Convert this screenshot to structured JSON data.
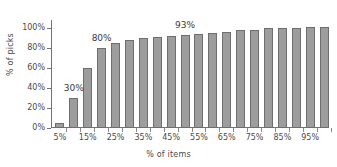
{
  "chart_data": {
    "type": "bar",
    "title": "",
    "xlabel": "% of items",
    "ylabel": "% of picks",
    "categories": [
      "5%",
      "10%",
      "15%",
      "20%",
      "25%",
      "30%",
      "35%",
      "40%",
      "45%",
      "50%",
      "55%",
      "60%",
      "65%",
      "70%",
      "75%",
      "80%",
      "85%",
      "90%",
      "95%",
      "100%"
    ],
    "values": [
      5,
      30,
      60,
      80,
      85,
      88,
      90,
      91,
      92,
      93,
      94,
      95,
      96,
      98,
      98,
      100,
      100,
      100,
      101,
      101
    ],
    "ylim": [
      0,
      108
    ],
    "xlim": [
      0,
      20
    ],
    "grid": false,
    "legend": null,
    "y_ticks": [
      "0%",
      "20%",
      "40%",
      "60%",
      "80%",
      "100%"
    ],
    "y_tick_values": [
      0,
      20,
      40,
      60,
      80,
      100
    ],
    "x_tick_labels": [
      "5%",
      "15%",
      "25%",
      "35%",
      "45%",
      "55%",
      "65%",
      "75%",
      "85%",
      "95%"
    ],
    "x_tick_label_indices": [
      0,
      2,
      4,
      6,
      8,
      10,
      12,
      14,
      16,
      18
    ],
    "annotations": [
      {
        "text": "30%",
        "bar_index": 1,
        "value": 30
      },
      {
        "text": "80%",
        "bar_index": 3,
        "value": 80
      },
      {
        "text": "93%",
        "bar_index": 9,
        "value": 93
      }
    ],
    "bar_color": "#9d9d9d",
    "bar_edge_color": "#6e6e6e",
    "axis_color": "#737373",
    "text_color": "#3a3a3a",
    "background_color": "#ffffff"
  }
}
